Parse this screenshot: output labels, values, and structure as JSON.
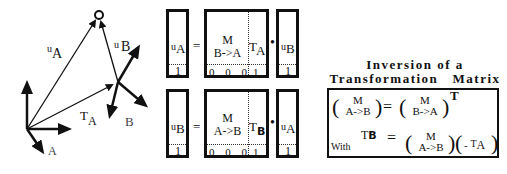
{
  "vector_diagram": {
    "labels": {
      "u_A": {
        "prefix": "u",
        "sub": "A"
      },
      "u_B": {
        "prefix": "u",
        "sub": "B"
      },
      "T_A": {
        "prefix": "T",
        "sub": "A"
      },
      "frame_A": "A",
      "frame_B": "B"
    },
    "point_icon": "circle-point-icon"
  },
  "equation1": {
    "lhs": {
      "prefix": "u",
      "sub": "A",
      "bottom": "1"
    },
    "equals": "=",
    "matrix": {
      "top": "M",
      "bottom_label": "B->A",
      "translation": {
        "prefix": "T",
        "sub": "A"
      },
      "last_row": [
        "0",
        "0",
        "0",
        "1"
      ]
    },
    "dot": "•",
    "rhs": {
      "prefix": "u",
      "sub": "B",
      "bottom": "1"
    }
  },
  "equation2": {
    "lhs": {
      "prefix": "u",
      "sub": "B",
      "bottom": "1"
    },
    "equals": "=",
    "matrix": {
      "top": "M",
      "bottom_label": "A->B",
      "translation": {
        "prefix": "T",
        "sub": "B"
      },
      "last_row": [
        "0",
        "0",
        "0",
        "1"
      ]
    },
    "dot": "•",
    "rhs": {
      "prefix": "u",
      "sub": "A",
      "bottom": "1"
    }
  },
  "inversion": {
    "title_line1": "Inversion of a",
    "title_line2": "Transformation   Matrix",
    "line1": {
      "lhs_top": "M",
      "lhs_bottom": "A->B",
      "equals": "=",
      "rhs_top": "M",
      "rhs_bottom": "B->A",
      "superscript": "T"
    },
    "line2": {
      "with_label": "With",
      "lhs_prefix": "T",
      "lhs_sub": "B",
      "equals": "=",
      "m_top": "M",
      "m_bottom": "A->B",
      "neg": "-",
      "t_prefix": "T",
      "t_sub": "A"
    }
  }
}
